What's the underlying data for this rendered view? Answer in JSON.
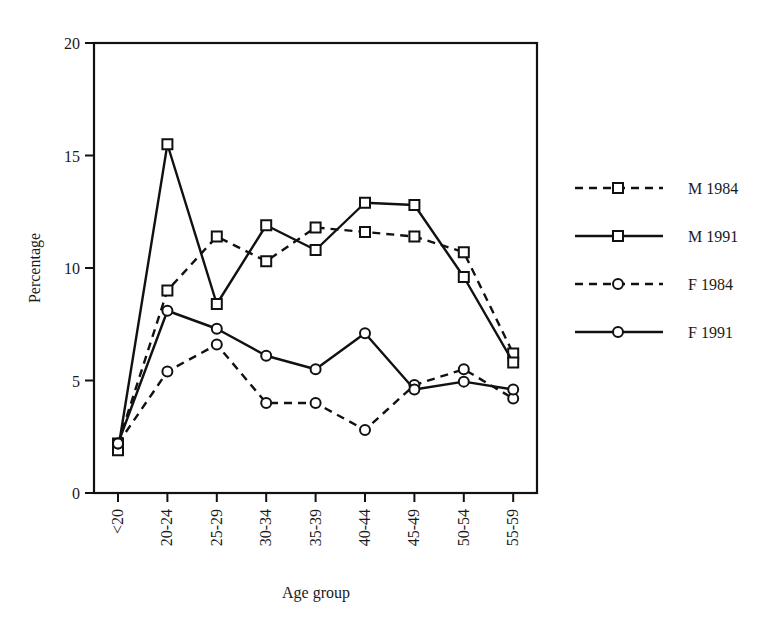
{
  "chart_data": {
    "type": "line",
    "title": "",
    "xlabel": "Age group",
    "ylabel": "Percentage",
    "ylim": [
      0,
      20
    ],
    "yticks": [
      0,
      5,
      10,
      15,
      20
    ],
    "ytick_labels": [
      "0",
      "5",
      "10",
      "15",
      "20"
    ],
    "grid": false,
    "legend_position": "right",
    "categories": [
      "<20",
      "20-24",
      "25-29",
      "30-34",
      "35-39",
      "40-44",
      "45-49",
      "50-54",
      "55-59"
    ],
    "series": [
      {
        "name": "M 1984",
        "line": "dashed",
        "marker": "square",
        "values": [
          2.2,
          9.0,
          11.4,
          10.3,
          11.8,
          11.6,
          11.4,
          10.7,
          6.2
        ]
      },
      {
        "name": "M 1991",
        "line": "solid",
        "marker": "square",
        "values": [
          1.9,
          15.5,
          8.4,
          11.9,
          10.8,
          12.9,
          12.8,
          9.6,
          5.8
        ]
      },
      {
        "name": "F 1984",
        "line": "dashed",
        "marker": "circle",
        "values": [
          2.2,
          5.4,
          6.6,
          4.0,
          4.0,
          2.8,
          4.8,
          5.5,
          4.2
        ]
      },
      {
        "name": "F 1991",
        "line": "solid",
        "marker": "circle",
        "values": [
          2.2,
          8.1,
          7.3,
          6.1,
          5.5,
          7.1,
          4.6,
          4.95,
          4.6
        ]
      }
    ]
  },
  "colors": {
    "ink": "#111111",
    "background": "#ffffff"
  }
}
